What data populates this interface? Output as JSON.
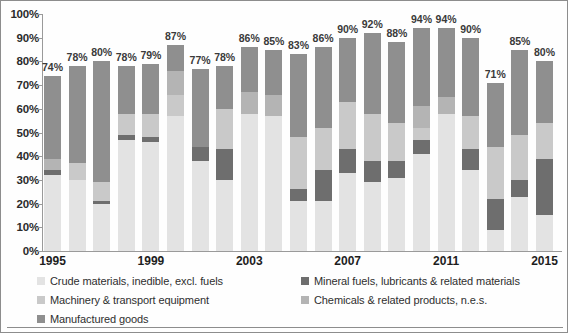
{
  "axis": {
    "y_ticks": [
      "100%",
      "90%",
      "80%",
      "70%",
      "60%",
      "50%",
      "40%",
      "30%",
      "20%",
      "10%",
      "0%"
    ],
    "x_ticks": [
      "1995",
      "1999",
      "2003",
      "2007",
      "2011",
      "2015"
    ]
  },
  "legend": {
    "items": [
      {
        "label": "Crude materials, inedible, excl. fuels",
        "color": "#e3e3e3",
        "key": "crude"
      },
      {
        "label": "Mineral fuels, lubricants & related materials",
        "color": "#6e6e6e",
        "key": "mineral"
      },
      {
        "label": "Machinery & transport equipment",
        "color": "#c9c9c9",
        "key": "machinery"
      },
      {
        "label": "Chemicals & related products, n.e.s.",
        "color": "#b4b4b4",
        "key": "chemicals"
      },
      {
        "label": "Manufactured goods",
        "color": "#8f8f8f",
        "key": "manufactured"
      }
    ]
  },
  "chart_data": {
    "type": "bar",
    "stacked": true,
    "title": "",
    "xlabel": "",
    "ylabel": "",
    "ylim": [
      0,
      100
    ],
    "grid": false,
    "legend_position": "bottom",
    "categories": [
      "1995",
      "1996",
      "1997",
      "1998",
      "1999",
      "2000",
      "2001",
      "2002",
      "2003",
      "2004",
      "2005",
      "2006",
      "2007",
      "2008",
      "2009",
      "2010",
      "2011",
      "2012",
      "2013",
      "2014",
      "2015"
    ],
    "totals": [
      74,
      78,
      80,
      78,
      79,
      87,
      77,
      78,
      86,
      85,
      83,
      86,
      90,
      92,
      88,
      94,
      94,
      90,
      71,
      85,
      80
    ],
    "total_labels": [
      "74%",
      "78%",
      "80%",
      "78%",
      "79%",
      "87%",
      "77%",
      "78%",
      "86%",
      "85%",
      "83%",
      "86%",
      "90%",
      "92%",
      "88%",
      "94%",
      "94%",
      "90%",
      "71%",
      "85%",
      "80%"
    ],
    "series": [
      {
        "name": "Crude materials, inedible, excl. fuels",
        "color": "#e3e3e3",
        "values": [
          32,
          30,
          20,
          47,
          46,
          57,
          38,
          30,
          58,
          57,
          21,
          21,
          33,
          29,
          31,
          41,
          58,
          34,
          9,
          23,
          15
        ]
      },
      {
        "name": "Mineral fuels, lubricants & related materials",
        "color": "#6e6e6e",
        "values": [
          2,
          0,
          1,
          2,
          2,
          0,
          6,
          13,
          0,
          0,
          5,
          13,
          10,
          9,
          7,
          6,
          0,
          9,
          13,
          7,
          24
        ]
      },
      {
        "name": "Machinery & transport equipment",
        "color": "#c9c9c9",
        "values": [
          0,
          7,
          8,
          9,
          10,
          9,
          0,
          17,
          0,
          0,
          22,
          18,
          20,
          20,
          16,
          5,
          0,
          14,
          22,
          19,
          15
        ]
      },
      {
        "name": "Chemicals & related products, n.e.s.",
        "color": "#b4b4b4",
        "values": [
          5,
          0,
          0,
          0,
          0,
          10,
          0,
          0,
          9,
          9,
          0,
          0,
          0,
          0,
          0,
          9,
          7,
          0,
          0,
          0,
          0
        ]
      },
      {
        "name": "Manufactured goods",
        "color": "#8f8f8f",
        "values": [
          35,
          41,
          51,
          20,
          21,
          11,
          33,
          18,
          19,
          19,
          35,
          34,
          27,
          34,
          34,
          33,
          29,
          33,
          27,
          36,
          26
        ]
      }
    ]
  }
}
